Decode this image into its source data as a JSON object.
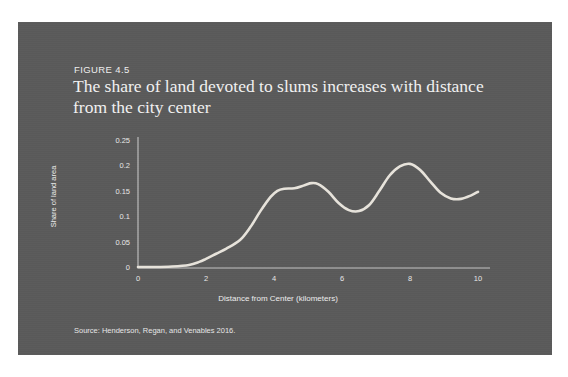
{
  "figure": {
    "number": "FIGURE 4.5",
    "title": "The share of land devoted to slums increases with distance from the city center",
    "source": "Source: Henderson, Regan, and Venables 2016.",
    "panel_color": "#5a5a5a",
    "line_color": "#e8e4dc",
    "axis_color": "#d8d8d8",
    "text_color": "#f0f0f0"
  },
  "chart_data": {
    "type": "line",
    "title": "The share of land devoted to slums increases with distance from the city center",
    "xlabel": "Distance from Center (kilometers)",
    "ylabel": "Share of land area",
    "xlim": [
      0,
      10
    ],
    "ylim": [
      0,
      0.25
    ],
    "xticks": [
      "0",
      "2",
      "4",
      "6",
      "8",
      "10"
    ],
    "xtick_values": [
      0,
      2,
      4,
      6,
      8,
      10
    ],
    "yticks": [
      "0",
      "0.05",
      "0.1",
      "0.15",
      "0.2",
      "0.25"
    ],
    "ytick_values": [
      0,
      0.05,
      0.1,
      0.15,
      0.2,
      0.25
    ],
    "grid": false,
    "legend": "none",
    "series": [
      {
        "name": "Share of land area",
        "x": [
          0.0,
          0.5,
          1.0,
          1.5,
          1.8,
          2.0,
          2.3,
          2.6,
          3.0,
          3.3,
          3.6,
          3.9,
          4.1,
          4.3,
          4.6,
          4.9,
          5.1,
          5.3,
          5.6,
          5.9,
          6.2,
          6.5,
          6.8,
          7.1,
          7.4,
          7.7,
          8.0,
          8.3,
          8.6,
          8.9,
          9.2,
          9.5,
          9.8,
          10.0
        ],
        "y": [
          0.002,
          0.002,
          0.003,
          0.006,
          0.012,
          0.018,
          0.028,
          0.038,
          0.055,
          0.08,
          0.112,
          0.14,
          0.152,
          0.156,
          0.157,
          0.163,
          0.167,
          0.165,
          0.15,
          0.128,
          0.114,
          0.112,
          0.124,
          0.152,
          0.182,
          0.2,
          0.205,
          0.193,
          0.17,
          0.148,
          0.137,
          0.136,
          0.143,
          0.15
        ]
      }
    ]
  }
}
